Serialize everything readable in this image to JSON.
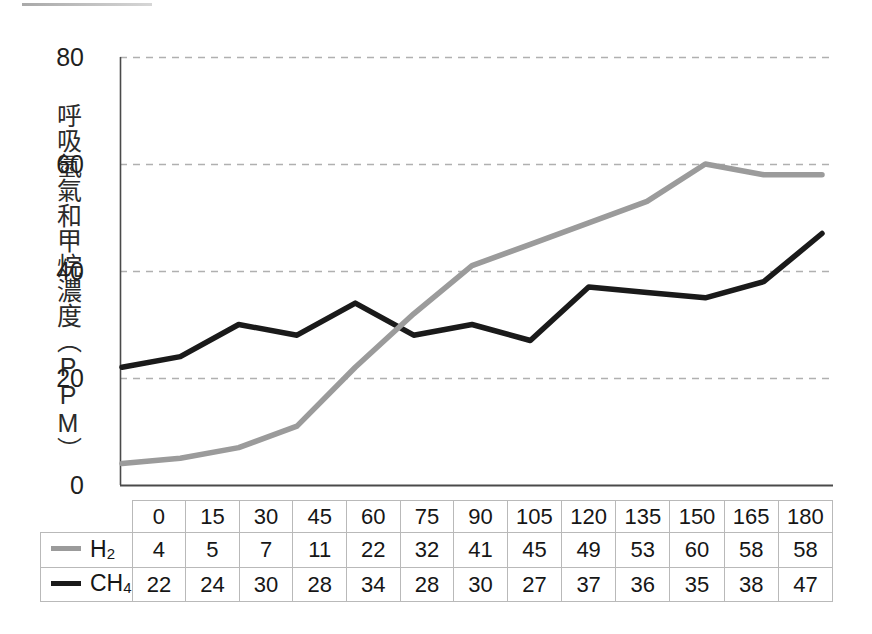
{
  "chart_data": {
    "type": "line",
    "title": "",
    "xlabel": "",
    "ylabel": "呼吸氫氣和甲烷濃度（PPM）",
    "categories": [
      0,
      15,
      30,
      45,
      60,
      75,
      90,
      105,
      120,
      135,
      150,
      165,
      180
    ],
    "series": [
      {
        "name": "H2",
        "label_html": "H<sub>2</sub>",
        "color": "#9b9b9b",
        "values": [
          4,
          5,
          7,
          11,
          22,
          32,
          41,
          45,
          49,
          53,
          60,
          58,
          58
        ]
      },
      {
        "name": "CH4",
        "label_html": "CH<sub>4</sub>",
        "color": "#1a1a1a",
        "values": [
          22,
          24,
          30,
          28,
          34,
          28,
          30,
          27,
          37,
          36,
          35,
          38,
          47
        ]
      }
    ],
    "ylim": [
      0,
      80
    ],
    "y_ticks": [
      0,
      20,
      40,
      60,
      80
    ],
    "grid": true,
    "grid_style": "dashed",
    "grid_color": "#b0b0b0",
    "legend_position": "table-row-header",
    "axis_color": "#4a4a4a"
  },
  "table": {
    "header_blank_label": "",
    "column_headers": [
      "0",
      "15",
      "30",
      "45",
      "60",
      "75",
      "90",
      "105",
      "120",
      "135",
      "150",
      "165",
      "180"
    ],
    "rows": [
      {
        "legend_label": "H2",
        "swatch_color": "#9b9b9b",
        "values": [
          "4",
          "5",
          "7",
          "11",
          "22",
          "32",
          "41",
          "45",
          "49",
          "53",
          "60",
          "58",
          "58"
        ]
      },
      {
        "legend_label": "CH4",
        "swatch_color": "#1a1a1a",
        "values": [
          "22",
          "24",
          "30",
          "28",
          "34",
          "28",
          "30",
          "27",
          "37",
          "36",
          "35",
          "38",
          "47"
        ]
      }
    ]
  },
  "axis": {
    "y_tick_labels": [
      "80",
      "60",
      "40",
      "20",
      "0"
    ]
  }
}
